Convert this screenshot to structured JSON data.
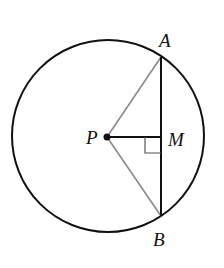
{
  "diagram": {
    "type": "geometry",
    "colors": {
      "stroke": "#111111",
      "radius_lines": "#8a8a8a",
      "background": "#ffffff"
    },
    "circle": {
      "cx": 108,
      "cy": 136,
      "r": 96
    },
    "points": [
      {
        "id": "P",
        "label": "P",
        "x": 107,
        "y": 137,
        "label_x": 86,
        "label_y": 144
      },
      {
        "id": "A",
        "label": "A",
        "x": 161,
        "y": 57,
        "label_x": 161,
        "label_y": 48
      },
      {
        "id": "B",
        "label": "B",
        "x": 161,
        "y": 216,
        "label_x": 152,
        "label_y": 246
      },
      {
        "id": "M",
        "label": "M",
        "x": 161,
        "y": 137,
        "label_x": 168,
        "label_y": 146
      }
    ],
    "segments": [
      {
        "from": "A",
        "to": "B",
        "style": "black"
      },
      {
        "from": "P",
        "to": "M",
        "style": "black"
      },
      {
        "from": "P",
        "to": "A",
        "style": "gray"
      },
      {
        "from": "P",
        "to": "B",
        "style": "gray"
      }
    ],
    "right_angle_at": "M"
  }
}
